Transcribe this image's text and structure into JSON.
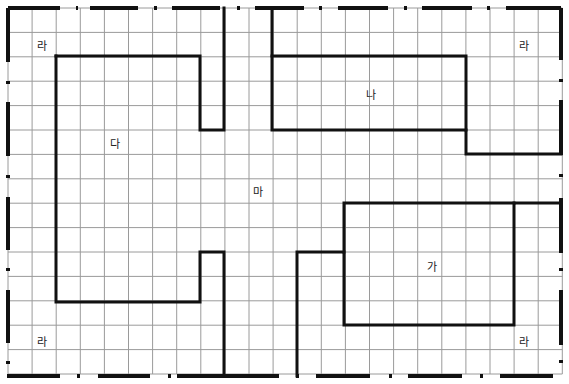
{
  "diagram": {
    "type": "floor-plan-grid",
    "grid": {
      "origin_x": 8,
      "origin_y": 8,
      "cell_w": 24.1,
      "cell_h": 24.4,
      "cols": 23,
      "rows": 15,
      "line_color": "#9a9a9a",
      "wall_color": "#111111"
    },
    "labels": [
      {
        "id": "ra-top-left",
        "text": "라",
        "x": 42,
        "y": 45
      },
      {
        "id": "ra-top-right",
        "text": "라",
        "x": 524,
        "y": 45
      },
      {
        "id": "ra-bottom-left",
        "text": "라",
        "x": 42,
        "y": 341
      },
      {
        "id": "ra-bottom-right",
        "text": "라",
        "x": 524,
        "y": 341
      },
      {
        "id": "na",
        "text": "나",
        "x": 371,
        "y": 94
      },
      {
        "id": "da",
        "text": "다",
        "x": 115,
        "y": 143
      },
      {
        "id": "ma",
        "text": "마",
        "x": 258,
        "y": 191
      },
      {
        "id": "ga",
        "text": "가",
        "x": 432,
        "y": 266
      }
    ],
    "walls": [
      {
        "id": "da-block",
        "points": "56,56 200,56 200,130 224,130 224,8"
      },
      {
        "id": "da-block-lower",
        "points": "224,376 224,252 200,252 200,302 56,302 56,56"
      },
      {
        "id": "na-block",
        "points": "272,8 272,130 466,130 466,154 561,154"
      },
      {
        "id": "na-top",
        "points": "272,56 466,56 466,130"
      },
      {
        "id": "ga-block",
        "points": "297,376 297,252 344,252 344,325 514,325 514,203 561,203"
      },
      {
        "id": "ga-top",
        "points": "344,252 344,203 514,203"
      }
    ],
    "boundary": {
      "top": [
        [
          8,
          60
        ],
        [
          76,
          78
        ],
        [
          90,
          138
        ],
        [
          154,
          157
        ],
        [
          172,
          220
        ],
        [
          237,
          240
        ],
        [
          255,
          304
        ],
        [
          319,
          322
        ],
        [
          338,
          388
        ],
        [
          404,
          407
        ],
        [
          422,
          472
        ],
        [
          487,
          490
        ],
        [
          506,
          561
        ]
      ],
      "bottom": [
        [
          7,
          60
        ],
        [
          77,
          80
        ],
        [
          98,
          150
        ],
        [
          168,
          171
        ],
        [
          177,
          279
        ],
        [
          296,
          299
        ],
        [
          316,
          370
        ],
        [
          389,
          392
        ],
        [
          408,
          462
        ],
        [
          480,
          483
        ],
        [
          500,
          553
        ]
      ],
      "left": [
        [
          8,
          62
        ],
        [
          81,
          84
        ],
        [
          102,
          156
        ],
        [
          175,
          178
        ],
        [
          197,
          250
        ],
        [
          268,
          271
        ],
        [
          290,
          343
        ],
        [
          361,
          364
        ]
      ],
      "right": [
        [
          8,
          60
        ],
        [
          79,
          82
        ],
        [
          100,
          155
        ],
        [
          174,
          177
        ],
        [
          198,
          253
        ],
        [
          268,
          271
        ],
        [
          290,
          345
        ],
        [
          360,
          363
        ]
      ]
    }
  }
}
